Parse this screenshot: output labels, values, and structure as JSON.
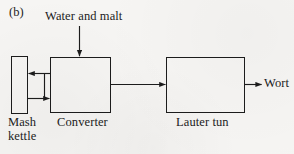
{
  "figure": {
    "panel_label": "(b)",
    "background_color": "#f6f5f3",
    "stroke_color": "#1c1c1c",
    "width": 294,
    "height": 154
  },
  "diagram": {
    "type": "process-flow",
    "nodes": [
      {
        "id": "mash-kettle",
        "label": "Mash kettle",
        "label_line1": "Mash",
        "label_line2": "kettle",
        "shape": "rectangle",
        "x": 11,
        "y": 56,
        "w": 16,
        "h": 57
      },
      {
        "id": "converter",
        "label": "Converter",
        "shape": "rectangle",
        "x": 50,
        "y": 57,
        "w": 60,
        "h": 56
      },
      {
        "id": "lauter-tun",
        "label": "Lauter tun",
        "shape": "rectangle",
        "x": 166,
        "y": 57,
        "w": 78,
        "h": 56
      }
    ],
    "streams": [
      {
        "id": "feed",
        "label": "Water and malt",
        "from": "external",
        "to": "converter",
        "direction": "down"
      },
      {
        "id": "converter-to-kettle",
        "label": "",
        "from": "converter",
        "to": "mash-kettle",
        "direction": "left"
      },
      {
        "id": "kettle-to-converter",
        "label": "",
        "from": "mash-kettle",
        "to": "converter",
        "direction": "right"
      },
      {
        "id": "converter-to-lauter",
        "label": "",
        "from": "converter",
        "to": "lauter-tun",
        "direction": "right"
      },
      {
        "id": "wort-out",
        "label": "Wort",
        "from": "lauter-tun",
        "to": "external",
        "direction": "right"
      }
    ]
  }
}
